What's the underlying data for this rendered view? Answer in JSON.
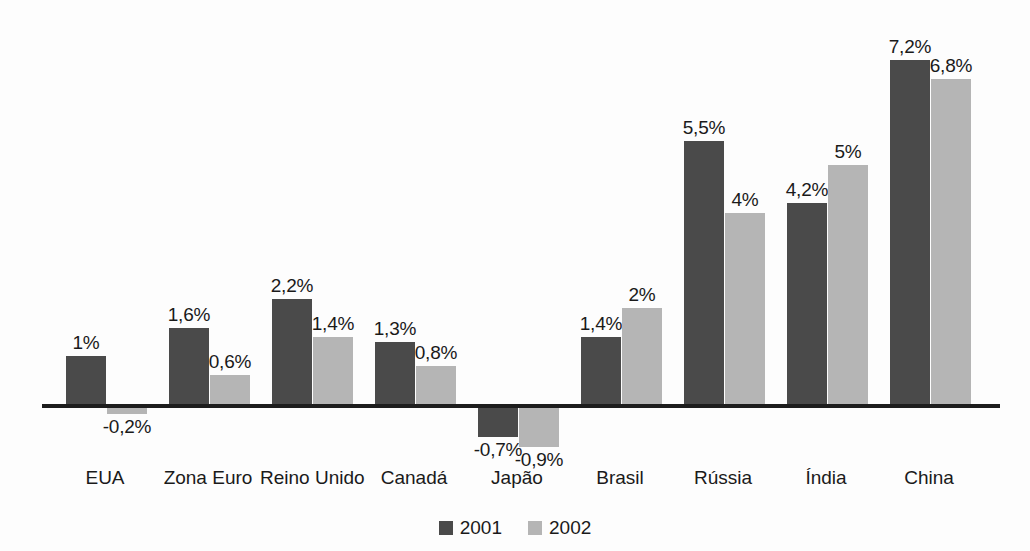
{
  "chart_data": {
    "type": "bar",
    "title": "",
    "subtitle": "",
    "xlabel": "",
    "ylabel": "",
    "grid": false,
    "legend_position": "bottom-center",
    "ylim": [
      -1.2,
      7.6
    ],
    "zero_line": true,
    "decimal_separator": ",",
    "value_suffix": "%",
    "categories": [
      "EUA",
      "Zona Euro",
      "Reino Unido",
      "Canadá",
      "Japão",
      "Brasil",
      "Rússia",
      "Índia",
      "China"
    ],
    "series": [
      {
        "name": "2001",
        "color": "#4a4a4a",
        "values": [
          1,
          1.6,
          2.2,
          1.3,
          -0.7,
          1.4,
          5.5,
          4.2,
          7.2
        ],
        "labels": [
          "1%",
          "1,6%",
          "2,2%",
          "1,3%",
          "-0,7%",
          "1,4%",
          "5,5%",
          "4,2%",
          "7,2%"
        ]
      },
      {
        "name": "2002",
        "color": "#b5b5b5",
        "values": [
          -0.2,
          0.6,
          1.4,
          0.8,
          -0.9,
          2,
          4,
          5,
          6.8
        ],
        "labels": [
          "-0,2%",
          "0,6%",
          "1,4%",
          "0,8%",
          "-0,9%",
          "2%",
          "4%",
          "5%",
          "6,8%"
        ]
      }
    ]
  },
  "legend": {
    "items": [
      {
        "label": "2001",
        "color": "#4a4a4a"
      },
      {
        "label": "2002",
        "color": "#b5b5b5"
      }
    ]
  },
  "colors": {
    "series_2001": "#4a4a4a",
    "series_2002": "#b5b5b5",
    "axis": "#1d1d1d",
    "text": "#1a1a1a",
    "background": "#fdfdfd"
  }
}
